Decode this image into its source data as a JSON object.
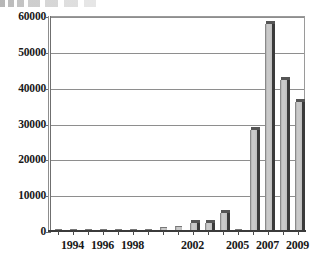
{
  "chart_data": {
    "type": "bar",
    "title": "",
    "subtitle": "",
    "xlabel": "",
    "ylabel": "",
    "ylim": [
      0,
      60000
    ],
    "ytick_values": [
      0,
      10000,
      20000,
      30000,
      40000,
      50000,
      60000
    ],
    "ytick_labels": [
      "0",
      "10000",
      "20000",
      "30000",
      "40000",
      "50000",
      "60000"
    ],
    "grid": true,
    "legend": "none",
    "categories": [
      "1993",
      "1994",
      "1995",
      "1996",
      "1997",
      "1998",
      "1999",
      "2000",
      "2001",
      "2002",
      "2003",
      "2004",
      "2005",
      "2006",
      "2007",
      "2008",
      "2009"
    ],
    "xtick_labels_shown": [
      "1994",
      "1996",
      "1998",
      "2002",
      "2005",
      "2007",
      "2009"
    ],
    "values": [
      30,
      60,
      90,
      140,
      260,
      300,
      330,
      800,
      1100,
      1900,
      2000,
      4700,
      60,
      28000,
      57500,
      41800,
      35800
    ],
    "bar_color": "#c3c3c3",
    "bar_edge_color": "#3a3a3a",
    "axis_color": "#4a4a4a",
    "grid_color": "#8e8e8e",
    "background": "#ffffff"
  }
}
